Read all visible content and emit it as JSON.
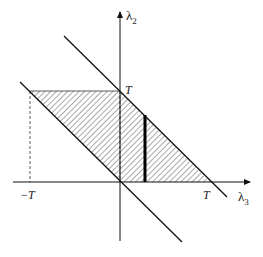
{
  "figure": {
    "type": "region-diagram",
    "axes": {
      "x_label": "λ",
      "x_label_sub": "3",
      "y_label": "λ",
      "y_label_sub": "2"
    },
    "tick_labels": {
      "x_pos": "T",
      "x_neg": "−T",
      "y_pos": "T"
    },
    "region": {
      "description": "Hatched parallelogram bounded by λ2 = T, λ2 = 0, λ2 + λ3 = 0, λ2 + λ3 = T",
      "vertices": [
        [
          "−T",
          "T"
        ],
        [
          "0",
          "T"
        ],
        [
          "T",
          "0"
        ],
        [
          "0",
          "0"
        ]
      ]
    },
    "lines": [
      {
        "name": "upper-diagonal",
        "equation": "λ2 + λ3 = T"
      },
      {
        "name": "lower-diagonal",
        "equation": "λ2 + λ3 = 0"
      }
    ],
    "highlight_segment": {
      "description": "Thick vertical segment inside the region at fixed λ3 ≈ 0.28T"
    },
    "colors": {
      "ink": "#111111",
      "hatch": "#555555",
      "background": "#ffffff"
    }
  }
}
